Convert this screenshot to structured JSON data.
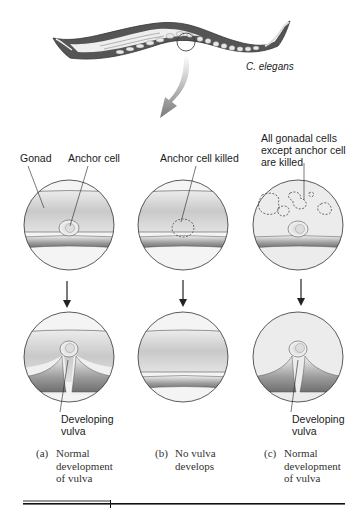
{
  "organism_label": "C. elegans",
  "top_labels": {
    "a_gonad": "Gonad",
    "a_anchor": "Anchor cell",
    "b_killed": "Anchor cell killed",
    "c_line1": "All gonadal cells",
    "c_line2": "except anchor cell",
    "c_line3": "are killed"
  },
  "bottom_labels": {
    "a_line1": "Developing",
    "a_line2": "vulva",
    "c_line1": "Developing",
    "c_line2": "vulva"
  },
  "captions": [
    {
      "letter": "(a)",
      "line1": "Normal",
      "line2": "development",
      "line3": "of vulva"
    },
    {
      "letter": "(b)",
      "line1": "No vulva",
      "line2": "develops",
      "line3": ""
    },
    {
      "letter": "(c)",
      "line1": "Normal",
      "line2": "development",
      "line3": "of vulva"
    }
  ],
  "colors": {
    "outline": "#333333",
    "gonad_fill": "#d6d6d6",
    "tissue_dark": "#8a8a8a",
    "background": "#ffffff"
  }
}
